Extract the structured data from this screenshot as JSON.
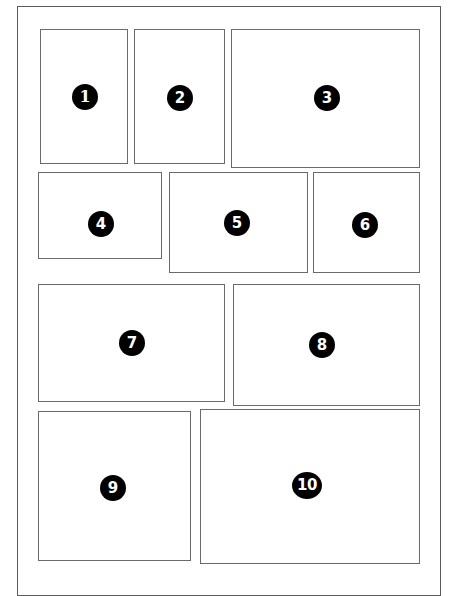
{
  "figure": {
    "background_color": "#ffffff",
    "frame_color": "#5b5b5b",
    "panel_border_color": "#6a6a6a",
    "badge_fill_color": "#000000",
    "badge_text_color": "#ffffff",
    "frame": {
      "x": 17,
      "y": 6,
      "width": 424,
      "height": 590
    },
    "panels": [
      {
        "label": "1",
        "x": 40,
        "y": 29,
        "width": 88,
        "height": 135,
        "badge_x": 84,
        "badge_y": 96
      },
      {
        "label": "2",
        "x": 134,
        "y": 29,
        "width": 91,
        "height": 135,
        "badge_x": 179,
        "badge_y": 97
      },
      {
        "label": "3",
        "x": 231,
        "y": 29,
        "width": 189,
        "height": 139,
        "badge_x": 326,
        "badge_y": 97
      },
      {
        "label": "4",
        "x": 38,
        "y": 172,
        "width": 124,
        "height": 87,
        "badge_x": 100,
        "badge_y": 223
      },
      {
        "label": "5",
        "x": 169,
        "y": 172,
        "width": 139,
        "height": 101,
        "badge_x": 236,
        "badge_y": 222
      },
      {
        "label": "6",
        "x": 313,
        "y": 172,
        "width": 107,
        "height": 101,
        "badge_x": 364,
        "badge_y": 224
      },
      {
        "label": "7",
        "x": 38,
        "y": 284,
        "width": 187,
        "height": 118,
        "badge_x": 131,
        "badge_y": 342
      },
      {
        "label": "8",
        "x": 233,
        "y": 284,
        "width": 187,
        "height": 122,
        "badge_x": 321,
        "badge_y": 344
      },
      {
        "label": "9",
        "x": 38,
        "y": 411,
        "width": 153,
        "height": 150,
        "badge_x": 112,
        "badge_y": 487
      },
      {
        "label": "10",
        "x": 200,
        "y": 409,
        "width": 220,
        "height": 155,
        "badge_x": 306,
        "badge_y": 484
      }
    ]
  }
}
